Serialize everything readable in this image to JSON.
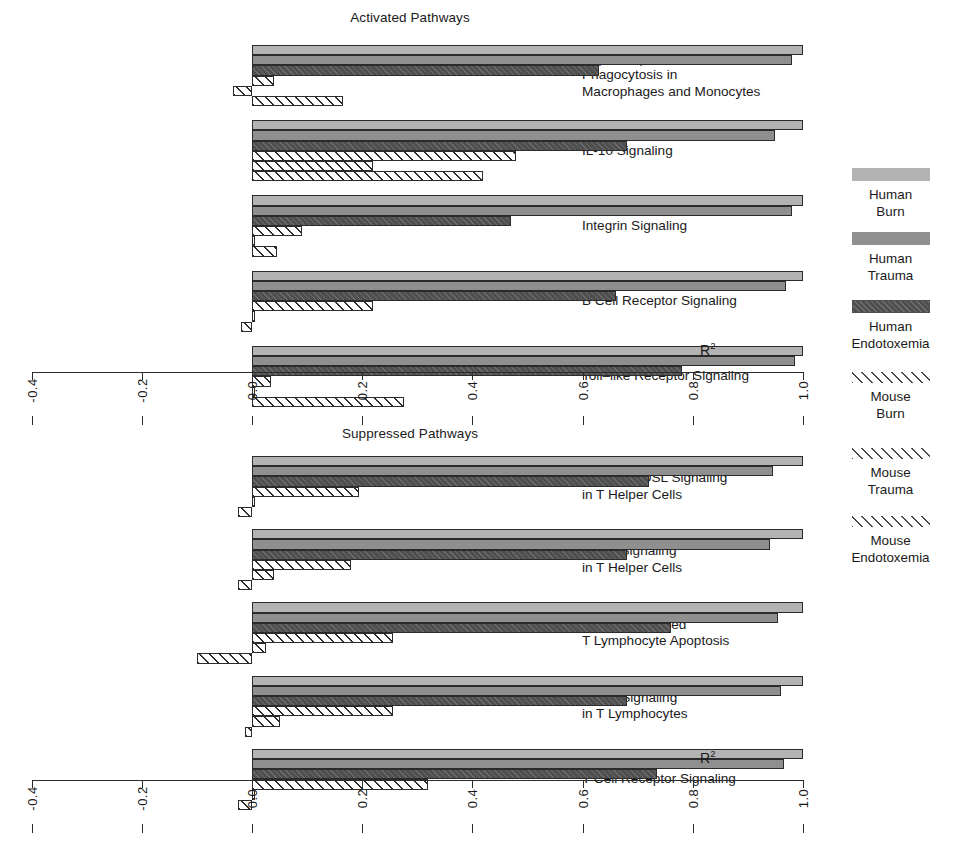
{
  "chart_data": {
    "type": "bar",
    "orientation": "horizontal",
    "title": "",
    "xlabel": "R²",
    "ylabel": "",
    "xlim": [
      -0.4,
      1.0
    ],
    "xticks": [
      "-0.4",
      "-0.2",
      "0.0",
      "0.2",
      "0.4",
      "0.6",
      "0.8",
      "1.0"
    ],
    "xtick_values": [
      -0.4,
      -0.2,
      0.0,
      0.2,
      0.4,
      0.6,
      0.8,
      1.0
    ],
    "grid": false,
    "legend_position": "right",
    "series": [
      {
        "name": "Human Burn",
        "color": "#b3b3b3",
        "fill": "solid"
      },
      {
        "name": "Human Trauma",
        "color": "#8f8f8f",
        "fill": "solid"
      },
      {
        "name": "Human Endotoxemia",
        "color": "#4f4f4f",
        "fill": "hatched-dark"
      },
      {
        "name": "Mouse Burn",
        "color": "#ffffff",
        "fill": "hatched-open"
      },
      {
        "name": "Mouse Trauma",
        "color": "#ffffff",
        "fill": "hatched-open"
      },
      {
        "name": "Mouse Endotoxemia",
        "color": "#ffffff",
        "fill": "hatched-open"
      }
    ],
    "panels": [
      {
        "title": "Activated Pathways",
        "axis_label": "R²",
        "categories": [
          "Fcγ Receptor–mediated\nPhagocytosis in\nMacrophages and Monocytes",
          "IL-10 Signaling",
          "Integrin Signaling",
          "B Cell Receptor Signaling",
          "Toll–like Receptor Signaling"
        ],
        "values": [
          [
            1.0,
            0.98,
            0.63,
            0.04,
            -0.035,
            0.165
          ],
          [
            1.0,
            0.95,
            0.68,
            0.48,
            0.22,
            0.42
          ],
          [
            1.0,
            0.98,
            0.47,
            0.09,
            0.005,
            0.045
          ],
          [
            1.0,
            0.97,
            0.66,
            0.22,
            0.005,
            -0.02
          ],
          [
            1.0,
            0.985,
            0.78,
            0.035,
            0.005,
            0.275
          ]
        ]
      },
      {
        "title": "Suppressed Pathways",
        "axis_label": "R²",
        "categories": [
          "iCOS—iCOSL Signaling\nin T Helper Cells",
          "CD28 Signaling\nin T Helper Cells",
          "Calcium–induced\nT Lymphocyte Apoptosis",
          "PKCθ Signaling\nin T Lymphocytes",
          "T Cell Receptor Signaling"
        ],
        "values": [
          [
            1.0,
            0.945,
            0.72,
            0.195,
            0.005,
            -0.025
          ],
          [
            1.0,
            0.94,
            0.68,
            0.18,
            0.04,
            -0.025
          ],
          [
            1.0,
            0.955,
            0.76,
            0.255,
            0.025,
            -0.1
          ],
          [
            1.0,
            0.96,
            0.68,
            0.255,
            0.05,
            -0.012
          ],
          [
            1.0,
            0.965,
            0.735,
            0.32,
            0.005,
            -0.025
          ]
        ]
      }
    ]
  },
  "legend": {
    "items": [
      {
        "label": "Human\nBurn",
        "swatch": "h1"
      },
      {
        "label": "Human\nTrauma",
        "swatch": "h2"
      },
      {
        "label": "Human\nEndotoxemia",
        "swatch": "h3"
      },
      {
        "label": "Mouse\nBurn",
        "swatch": "m"
      },
      {
        "label": "Mouse\nTrauma",
        "swatch": "m"
      },
      {
        "label": "Mouse\nEndotoxemia",
        "swatch": "m"
      }
    ]
  }
}
